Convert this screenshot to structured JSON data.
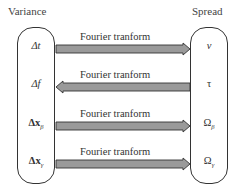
{
  "diagram": {
    "left": {
      "title": "Variance",
      "items": [
        {
          "main": "Δt",
          "sub": ""
        },
        {
          "main": "Δf",
          "sub": ""
        },
        {
          "main": "Δx",
          "sub": "β"
        },
        {
          "main": "Δx",
          "sub": "γ"
        }
      ]
    },
    "right": {
      "title": "Spread",
      "items": [
        {
          "main": "ν",
          "sub": ""
        },
        {
          "main": "τ",
          "sub": ""
        },
        {
          "main": "Ω",
          "sub": "β"
        },
        {
          "main": "Ω",
          "sub": "γ"
        }
      ]
    },
    "arrows": [
      {
        "label": "Fourier tranform",
        "direction": "right"
      },
      {
        "label": "Fourier tranform",
        "direction": "left"
      },
      {
        "label": "Fourier tranform",
        "direction": "right"
      },
      {
        "label": "Fourier tranform",
        "direction": "right"
      }
    ],
    "colors": {
      "arrow_fill": "#9a9a9a",
      "arrow_stroke": "#333333",
      "box_stroke": "#333333"
    }
  }
}
